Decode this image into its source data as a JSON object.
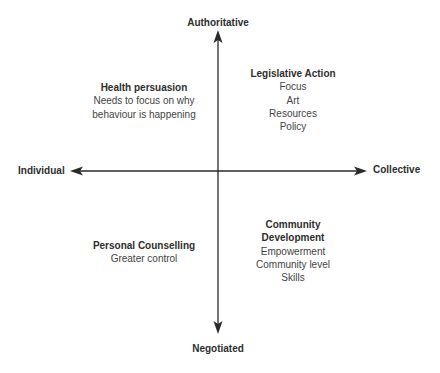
{
  "axes": {
    "top": "Authoritative",
    "bottom": "Negotiated",
    "left": "Individual",
    "right": "Collective"
  },
  "quadrants": {
    "top_left": {
      "title": "Health persuasion",
      "lines": [
        "Needs to focus on why",
        "behaviour is happening"
      ]
    },
    "top_right": {
      "title": "Legislative Action",
      "lines": [
        "Focus",
        "Art",
        "Resources",
        "Policy"
      ]
    },
    "bottom_left": {
      "title": "Personal Counselling",
      "lines": [
        "Greater control"
      ]
    },
    "bottom_right": {
      "title_lines": [
        "Community",
        "Development"
      ],
      "lines": [
        "Empowerment",
        "Community level",
        "Skills"
      ]
    }
  },
  "colors": {
    "line": "#2a2a2a",
    "text": "#2a2a2a"
  }
}
